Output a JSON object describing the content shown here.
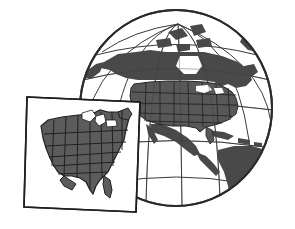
{
  "canvas": {
    "width": 295,
    "height": 229,
    "background": "#fefefe",
    "title": "Globe with North America and inset map of the contiguous United States"
  },
  "palette": {
    "background": "#fefefe",
    "globe_outline": "#2b2b2b",
    "graticule": "#3a3a3a",
    "ocean": "#ffffff",
    "land_dark": "#4a4a4a",
    "land_states": "#595959",
    "state_border": "#242424",
    "lake_water": "#f2f2f2",
    "inset_frame": "#1f1f1f",
    "inset_background": "#ffffff",
    "inset_land": "#5c5c5c",
    "inset_border": "#202020"
  },
  "globe": {
    "label": "globe",
    "center_x": 176,
    "center_y": 108,
    "radius_x": 96,
    "radius_y": 98,
    "pole_x": 178,
    "pole_y": 24,
    "outline_width": 2,
    "graticule_width": 1,
    "meridian_count": 7,
    "parallel_count": 5,
    "landmasses": [
      "north-america",
      "canada-arctic-islands",
      "greenland-edge",
      "mexico",
      "central-america",
      "cuba",
      "caribbean-islands",
      "south-america-north"
    ]
  },
  "inset": {
    "label": "inset-map-united-states",
    "frame": {
      "corners": "27,97 140,102 136,212 24,207",
      "stroke_width": 1.6
    },
    "region": "Contiguous United States",
    "features": [
      "state-boundaries",
      "great-lakes",
      "florida-peninsula",
      "texas-gulf-coast",
      "new-england"
    ],
    "state_count": 48
  },
  "legend": {
    "globe_caption": "",
    "inset_caption": ""
  }
}
